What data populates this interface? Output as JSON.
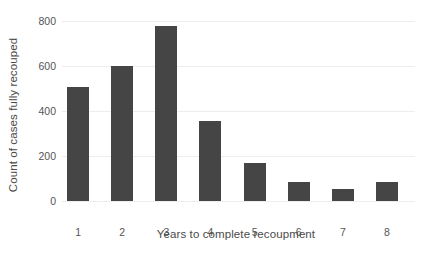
{
  "chart_data": {
    "type": "bar",
    "title": "",
    "subtitle": "",
    "xlabel": "Years to complete recoupment",
    "ylabel": "Count of cases fully recouped",
    "categories": [
      "1",
      "2",
      "3",
      "4",
      "5",
      "6",
      "7",
      "8"
    ],
    "values": [
      505,
      598,
      778,
      356,
      170,
      85,
      53,
      85
    ],
    "series": [
      {
        "name": "Count of cases fully recouped",
        "values": [
          505,
          598,
          778,
          356,
          170,
          85,
          53,
          85
        ]
      }
    ],
    "ylim": [
      0,
      800
    ],
    "yticks": [
      0,
      200,
      400,
      600,
      800
    ],
    "ytick_labels": [
      "0",
      "200",
      "400",
      "600",
      "800"
    ],
    "xtick_labels": [
      "1",
      "2",
      "3",
      "4",
      "5",
      "6",
      "7",
      "8"
    ],
    "grid": "horizontal",
    "legend": "none",
    "bar_color": "#454545",
    "gridline_color": "#ededed",
    "background_color": "#ffffff",
    "axis_text_color": "#555555",
    "axis_title_color": "#4a4a4a"
  }
}
